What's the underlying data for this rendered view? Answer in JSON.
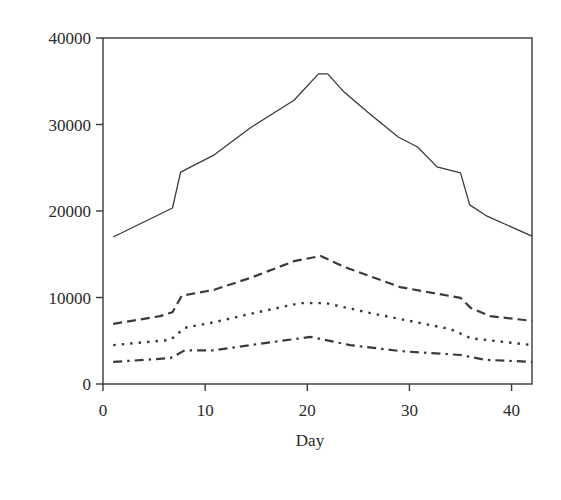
{
  "chart_data": {
    "type": "line",
    "title": "",
    "xlabel": "Day",
    "ylabel": "",
    "xlim": [
      0,
      42
    ],
    "ylim": [
      0,
      40000
    ],
    "xticks": [
      0,
      10,
      20,
      30,
      40
    ],
    "yticks": [
      0,
      10000,
      20000,
      30000,
      40000
    ],
    "xtick_labels": [
      "0",
      "10",
      "20",
      "30",
      "40"
    ],
    "ytick_labels": [
      "0",
      "10000",
      "20000",
      "30000",
      "40000"
    ],
    "grid": false,
    "legend": null,
    "series": [
      {
        "name": "series-1 (solid)",
        "style": "solid",
        "points": [
          [
            1,
            17000
          ],
          [
            6.8,
            20350
          ],
          [
            7.6,
            24500
          ],
          [
            10.9,
            26500
          ],
          [
            14.4,
            29600
          ],
          [
            18.7,
            32800
          ],
          [
            21.1,
            35850
          ],
          [
            22,
            35850
          ],
          [
            23.6,
            33750
          ],
          [
            25.9,
            31450
          ],
          [
            28.9,
            28550
          ],
          [
            30.8,
            27400
          ],
          [
            32.7,
            25100
          ],
          [
            35,
            24400
          ],
          [
            35.9,
            20700
          ],
          [
            37.6,
            19400
          ],
          [
            42,
            17100
          ]
        ]
      },
      {
        "name": "series-2 (dashed)",
        "style": "dashed",
        "points": [
          [
            1,
            6950
          ],
          [
            5.6,
            7850
          ],
          [
            6.8,
            8300
          ],
          [
            7.7,
            10200
          ],
          [
            10.9,
            10900
          ],
          [
            14.4,
            12250
          ],
          [
            18.7,
            14200
          ],
          [
            21.3,
            14800
          ],
          [
            23.7,
            13500
          ],
          [
            29.1,
            11200
          ],
          [
            35,
            9950
          ],
          [
            36,
            8800
          ],
          [
            37.9,
            7850
          ],
          [
            42,
            7300
          ]
        ]
      },
      {
        "name": "series-3 (dotted)",
        "style": "dotted",
        "points": [
          [
            1,
            4500
          ],
          [
            6.6,
            5100
          ],
          [
            8,
            6500
          ],
          [
            10.9,
            7150
          ],
          [
            14.4,
            8100
          ],
          [
            19.3,
            9350
          ],
          [
            21.8,
            9350
          ],
          [
            26.2,
            8200
          ],
          [
            34,
            6350
          ],
          [
            36,
            5300
          ],
          [
            42,
            4500
          ]
        ]
      },
      {
        "name": "series-4 (dash-dot)",
        "style": "dashdot",
        "points": [
          [
            1,
            2550
          ],
          [
            6.6,
            3000
          ],
          [
            8,
            3900
          ],
          [
            10.9,
            3900
          ],
          [
            14.4,
            4500
          ],
          [
            20.3,
            5450
          ],
          [
            24.2,
            4500
          ],
          [
            29.1,
            3800
          ],
          [
            35,
            3350
          ],
          [
            37.4,
            2800
          ],
          [
            42,
            2550
          ]
        ]
      }
    ]
  },
  "plot_area": {
    "left": 103,
    "top": 38,
    "right": 532,
    "bottom": 384
  }
}
